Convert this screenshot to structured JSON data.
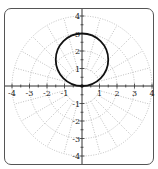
{
  "chart_data": {
    "type": "line",
    "subtype": "polar",
    "title": "",
    "xlabel": "",
    "ylabel": "",
    "xlim": [
      -4,
      4
    ],
    "ylim": [
      -4,
      4
    ],
    "x_ticks": [
      -4,
      -3,
      -2,
      -1,
      1,
      2,
      3,
      4
    ],
    "y_ticks": [
      -4,
      -3,
      -2,
      -1,
      1,
      2,
      3,
      4
    ],
    "x_tick_labels": [
      "-4",
      "-3",
      "-2",
      "-1",
      "1",
      "2",
      "3",
      "4"
    ],
    "y_tick_labels": [
      "-4",
      "-3",
      "-2",
      "-1",
      "1",
      "2",
      "3",
      "4"
    ],
    "grid": {
      "style": "polar dotted",
      "circle_radii": [
        1,
        2,
        3,
        4
      ],
      "radial_step_degrees": 15,
      "color": "#b0b0b0"
    },
    "series": [
      {
        "name": "r = 3 sin(theta)",
        "shape": "circle",
        "center": [
          0,
          1.5
        ],
        "radius": 1.5,
        "points": [
          [
            0,
            0
          ],
          [
            1.5,
            1.5
          ],
          [
            0,
            3
          ],
          [
            -1.5,
            1.5
          ]
        ],
        "color": "#111111"
      }
    ],
    "legend": null
  },
  "colors": {
    "curve": "#111111",
    "axis": "#333333",
    "grid": "#b0b0b0",
    "frame": "#555555"
  }
}
